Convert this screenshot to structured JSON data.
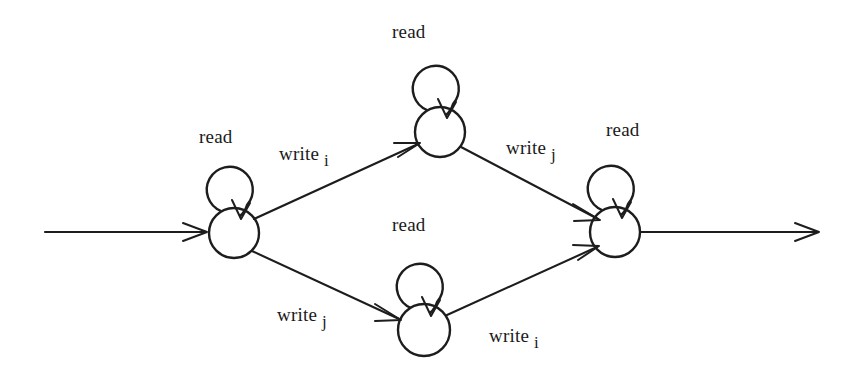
{
  "diagram": {
    "type": "state-machine",
    "background_color": "#ffffff",
    "stroke_color": "#1d1d1d",
    "states": [
      {
        "id": "s0",
        "name": "start-state",
        "cx": 234,
        "cy": 233,
        "r": 25,
        "self_loop_label": "read"
      },
      {
        "id": "s1",
        "name": "upper-state",
        "cx": 440,
        "cy": 132,
        "r": 25,
        "self_loop_label": "read"
      },
      {
        "id": "s2",
        "name": "lower-state",
        "cx": 424,
        "cy": 330,
        "r": 26,
        "self_loop_label": "read"
      },
      {
        "id": "s3",
        "name": "final-state",
        "cx": 615,
        "cy": 232,
        "r": 25,
        "self_loop_label": "read"
      }
    ],
    "self_loop_labels": [
      {
        "name": "self-loop-label-start",
        "text": "read",
        "x": 199,
        "y": 127
      },
      {
        "name": "self-loop-label-upper",
        "text": "read",
        "x": 392,
        "y": 22
      },
      {
        "name": "self-loop-label-lower",
        "text": "read",
        "x": 392,
        "y": 215
      },
      {
        "name": "self-loop-label-final",
        "text": "read",
        "x": 606,
        "y": 120
      }
    ],
    "transitions": [
      {
        "name": "transition-start-to-upper",
        "verb": "write",
        "operand": "i",
        "from": "s0",
        "to": "s1",
        "label_x": 279,
        "label_y": 144
      },
      {
        "name": "transition-upper-to-final",
        "verb": "write",
        "operand": "j",
        "from": "s1",
        "to": "s3",
        "label_x": 506,
        "label_y": 138
      },
      {
        "name": "transition-start-to-lower",
        "verb": "write",
        "operand": "j",
        "from": "s0",
        "to": "s2",
        "label_x": 277,
        "label_y": 305
      },
      {
        "name": "transition-lower-to-final",
        "verb": "write",
        "operand": "i",
        "from": "s2",
        "to": "s3",
        "label_x": 489,
        "label_y": 326
      }
    ],
    "entry_arrow": {
      "name": "entry-arrow",
      "x1": 45,
      "y1": 232,
      "x2": 206,
      "y2": 232
    },
    "exit_arrow": {
      "name": "exit-arrow",
      "x1": 641,
      "y1": 232,
      "x2": 820,
      "y2": 232
    }
  }
}
